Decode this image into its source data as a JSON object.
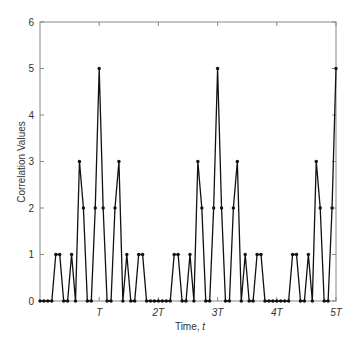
{
  "chart_data": {
    "type": "line",
    "title": "",
    "xlabel": "Time, t",
    "xlabel_parts": {
      "text": "Time, ",
      "var": "t"
    },
    "ylabel": "Correlation Values",
    "ylim": [
      0,
      6
    ],
    "xlim": [
      0,
      5
    ],
    "x_unit": "T",
    "y_ticks": [
      0,
      1,
      2,
      3,
      4,
      5,
      6
    ],
    "x_ticks": [
      {
        "value": 1,
        "label": "T"
      },
      {
        "value": 2,
        "label": "2T"
      },
      {
        "value": 3,
        "label": "3T"
      },
      {
        "value": 4,
        "label": "4T"
      },
      {
        "value": 5,
        "label": "5T"
      }
    ],
    "samples_per_T": 15,
    "grid": false,
    "legend": null,
    "marker": "dot",
    "line_color": "#111111",
    "series": [
      {
        "name": "correlation",
        "x_samples": [
          0,
          1,
          2,
          3,
          4,
          5,
          6,
          7,
          8,
          9,
          10,
          11,
          12,
          13,
          14,
          15,
          16,
          17,
          18,
          19,
          20,
          21,
          22,
          23,
          24,
          25,
          26,
          27,
          28,
          29,
          30,
          31,
          32,
          33,
          34,
          35,
          36,
          37,
          38,
          39,
          40,
          41,
          42,
          43,
          44,
          45,
          46,
          47,
          48,
          49,
          50,
          51,
          52,
          53,
          54,
          55,
          56,
          57,
          58,
          59,
          60,
          61,
          62,
          63,
          64,
          65,
          66,
          67,
          68,
          69,
          70,
          71,
          72,
          73,
          74,
          75
        ],
        "values": [
          0,
          0,
          0,
          0,
          1,
          1,
          0,
          0,
          1,
          0,
          3,
          2,
          0,
          0,
          2,
          5,
          2,
          0,
          0,
          2,
          3,
          0,
          1,
          0,
          0,
          1,
          1,
          0,
          0,
          0,
          0,
          0,
          0,
          0,
          1,
          1,
          0,
          0,
          1,
          0,
          3,
          2,
          0,
          0,
          2,
          5,
          2,
          0,
          0,
          2,
          3,
          0,
          1,
          0,
          0,
          1,
          1,
          0,
          0,
          0,
          0,
          0,
          0,
          0,
          1,
          1,
          0,
          0,
          1,
          0,
          3,
          2,
          0,
          0,
          2,
          5
        ]
      }
    ]
  }
}
